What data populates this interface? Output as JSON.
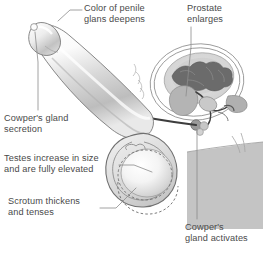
{
  "figure": {
    "background_color": "#ffffff",
    "text_color": "#4a4a4a",
    "leader_line_color": "#8c8c8c",
    "outline_color": "#6e6e6e",
    "body_mass_color": "#c4c4c4",
    "seminal_vesicle_color": "#6b6b6b",
    "prostate_color": "#b4b4b4",
    "pelvis_fill_color": "#d9d9d9",
    "urethra_color": "#3d3d3d"
  },
  "callouts": [
    {
      "id": "glans",
      "label": "Color of penile\nglans deepens",
      "points_to": "penile-glans"
    },
    {
      "id": "prostate",
      "label": "Prostate\nenlarges",
      "points_to": "prostate-gland"
    },
    {
      "id": "cowper_secretion",
      "label": "Cowper's gland\nsecretion",
      "points_to": "urethral-meatus"
    },
    {
      "id": "testes",
      "label": "Testes increase in size\nand are fully elevated",
      "points_to": "testis"
    },
    {
      "id": "scrotum",
      "label": "Scrotum thickens\nand tenses",
      "points_to": "scrotum-wall"
    },
    {
      "id": "cowper_activates",
      "label": "Cowper's\ngland activates",
      "points_to": "cowpers-gland"
    }
  ],
  "anatomy_parts": [
    {
      "name": "penile-glans",
      "description": "Glans penis at upper left of shaft"
    },
    {
      "name": "penile-shaft",
      "description": "Erect penile shaft angled upward to the left"
    },
    {
      "name": "urethra-line",
      "description": "Dark urethral channel running the length of the shaft"
    },
    {
      "name": "scrotum-wall",
      "description": "Thickened scrotal sac below the shaft base"
    },
    {
      "name": "testis",
      "description": "Elevated testis shown as shaded sphere"
    },
    {
      "name": "testis-previous-position",
      "description": "Dashed outline of unelevated testis position"
    },
    {
      "name": "prostate-gland",
      "description": "Enlarged prostate below the bladder"
    },
    {
      "name": "seminal-vesicle",
      "description": "Dark lobed seminal vesicle structure"
    },
    {
      "name": "bladder",
      "description": "Bladder outline within pelvic oval"
    },
    {
      "name": "cowpers-gland",
      "description": "Small bulbourethral gland near the perineum"
    },
    {
      "name": "vas-deferens",
      "description": "Ducts extending from the seminal vesicle"
    },
    {
      "name": "pelvic-outline",
      "description": "Concentric oval lines marking the pelvic region"
    },
    {
      "name": "body-mass",
      "description": "Shaded block representing buttock and thigh"
    }
  ]
}
